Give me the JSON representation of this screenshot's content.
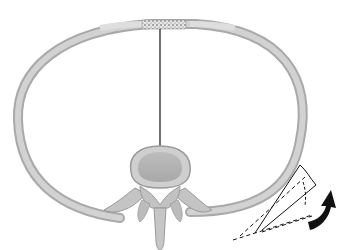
{
  "diagram": {
    "title": "",
    "elements": [
      {
        "id": "rib-ring",
        "label": "Rib"
      },
      {
        "id": "sternum",
        "label": "Sternum (cartilaginous, stippled)"
      },
      {
        "id": "costal-cartilage",
        "label": "Costal cartilage segments"
      },
      {
        "id": "vertebral-body",
        "label": "Vertebral body"
      },
      {
        "id": "transverse-process",
        "label": "Transverse processes"
      },
      {
        "id": "spinous-process",
        "label": "Spinous process"
      },
      {
        "id": "midline",
        "label": "Anteroposterior midline"
      },
      {
        "id": "rotation-angle",
        "label": "Rib rotation angle (dashed lines)"
      },
      {
        "id": "rotation-arrow",
        "label": "Upward rotation arrow"
      }
    ],
    "colors": {
      "bone": "#c8c8c8",
      "bone_edge": "#a9a9a9",
      "bone_dark": "#9a9a9a",
      "cartilage": "#d6d6d6",
      "ink": "#111111",
      "background": "#ffffff"
    }
  }
}
